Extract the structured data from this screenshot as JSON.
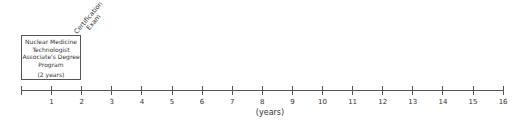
{
  "program_box": {
    "lines": [
      "Nuclear Medicine",
      "Technologist",
      "Associate's Degree",
      "Program"
    ],
    "duration": "(2 years)",
    "start_year": 0,
    "end_year": 2
  },
  "milestone": {
    "line1": "Certification",
    "line2": "Exam",
    "at_year": 2
  },
  "axis": {
    "unit_label": "(years)",
    "ticks": [
      "",
      "1",
      "2",
      "3",
      "4",
      "5",
      "6",
      "7",
      "8",
      "9",
      "10",
      "11",
      "12",
      "13",
      "14",
      "15",
      "16"
    ]
  }
}
